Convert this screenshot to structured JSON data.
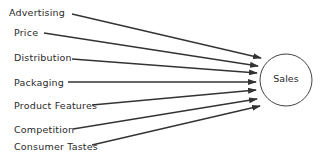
{
  "diagram": {
    "type": "influence-diagram",
    "factors": [
      {
        "label": "Advertising",
        "x": 9,
        "y": 7,
        "line_start": [
          72,
          14
        ],
        "arrow_tip": [
          261,
          58
        ]
      },
      {
        "label": "Price",
        "x": 14,
        "y": 27,
        "line_start": [
          44,
          33
        ],
        "arrow_tip": [
          258,
          66
        ]
      },
      {
        "label": "Distribution",
        "x": 14,
        "y": 52,
        "line_start": [
          72,
          59
        ],
        "arrow_tip": [
          257,
          73
        ]
      },
      {
        "label": "Packaging",
        "x": 14,
        "y": 77,
        "line_start": [
          68,
          82
        ],
        "arrow_tip": [
          256,
          82
        ]
      },
      {
        "label": "Product Features",
        "x": 14,
        "y": 100,
        "line_start": [
          92,
          105
        ],
        "arrow_tip": [
          256,
          90
        ]
      },
      {
        "label": "Competition",
        "x": 14,
        "y": 124,
        "line_start": [
          73,
          129
        ],
        "arrow_tip": [
          257,
          99
        ]
      },
      {
        "label": "Consumer Tastes",
        "x": 14,
        "y": 141,
        "line_start": [
          92,
          145
        ],
        "arrow_tip": [
          260,
          106
        ]
      }
    ],
    "target": {
      "label": "Sales",
      "cx": 286,
      "cy": 80,
      "r": 26
    },
    "colors": {
      "line": "#333333",
      "text": "#2a2a2a",
      "circle": "#444444"
    }
  }
}
